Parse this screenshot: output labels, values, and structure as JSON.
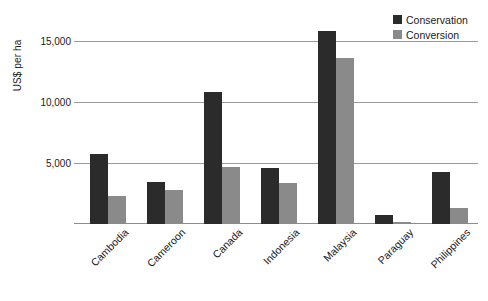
{
  "chart_data": {
    "type": "bar",
    "title": "",
    "xlabel": "",
    "ylabel": "US$ per ha",
    "ylim": [
      0,
      17200
    ],
    "yticks": [
      5000,
      10000,
      15000
    ],
    "ytick_labels": [
      "5,000",
      "10,000",
      "15,000"
    ],
    "grid": "horizontal",
    "legend_position": "top-right",
    "categories": [
      "Cambodia",
      "Cameroon",
      "Canada",
      "Indonesia",
      "Malaysia",
      "Paraguay",
      "Philippines"
    ],
    "series": [
      {
        "name": "Conservation",
        "color": "#2b2b2b",
        "values": [
          5750,
          3450,
          10850,
          4600,
          15800,
          700,
          4250
        ]
      },
      {
        "name": "Conversion",
        "color": "#8a8a8a",
        "values": [
          2300,
          2750,
          4700,
          3400,
          13600,
          150,
          1300
        ]
      }
    ]
  }
}
